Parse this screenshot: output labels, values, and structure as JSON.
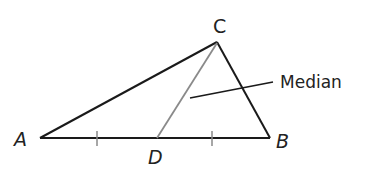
{
  "diagram": {
    "type": "triangle-median",
    "vertices": {
      "A": {
        "label": "A",
        "x": 40,
        "y": 138
      },
      "B": {
        "label": "B",
        "x": 270,
        "y": 138
      },
      "C": {
        "label": "C",
        "x": 217,
        "y": 42
      },
      "D": {
        "label": "D",
        "x": 157,
        "y": 138
      }
    },
    "labels": {
      "A": "A",
      "B": "B",
      "C": "C",
      "D": "D",
      "median": "Median"
    },
    "colors": {
      "sides": "#1a1a1a",
      "median": "#8a8a8a",
      "ticks": "#8a8a8a"
    }
  }
}
